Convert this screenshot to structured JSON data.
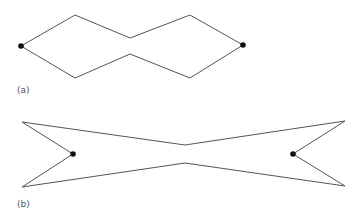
{
  "figures": [
    {
      "label": "(a)",
      "description": "Closed hexagonal outline with two pinched sides, vertices marked by black dots at left and right ends",
      "polygon": [
        [
          21,
          46
        ],
        [
          75,
          15
        ],
        [
          130,
          38
        ],
        [
          190,
          15
        ],
        [
          243,
          45
        ],
        [
          190,
          78
        ],
        [
          130,
          54
        ],
        [
          75,
          78
        ]
      ],
      "dots": [
        [
          21,
          46
        ],
        [
          243,
          45
        ]
      ],
      "label_pos": [
        17,
        85
      ]
    },
    {
      "label": "(b)",
      "description": "Bow-tie shaped closed outline with concave notches at both ends, dots at notch vertices",
      "polygon": [
        [
          22,
          122
        ],
        [
          185,
          145
        ],
        [
          345,
          121
        ],
        [
          293,
          154
        ],
        [
          345,
          186
        ],
        [
          185,
          163
        ],
        [
          22,
          187
        ],
        [
          73,
          154
        ]
      ],
      "dots": [
        [
          73,
          154
        ],
        [
          293,
          154
        ]
      ],
      "label_pos": [
        17,
        199
      ]
    }
  ],
  "colors": {
    "stroke": "#555555",
    "dot": "#111111",
    "background": "#ffffff"
  }
}
